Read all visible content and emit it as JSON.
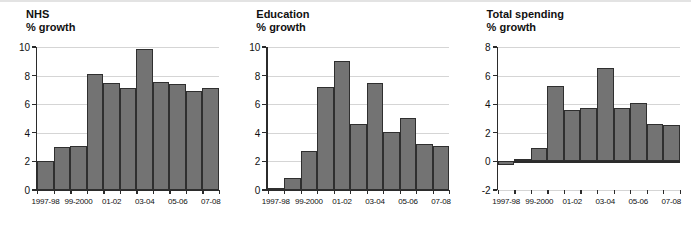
{
  "chart_data": [
    {
      "type": "bar",
      "title": "NHS",
      "subtitle": "% growth",
      "xlabel": "",
      "ylabel": "% growth",
      "ylim": [
        0,
        10
      ],
      "yticks": [
        0,
        2,
        4,
        6,
        8,
        10
      ],
      "ytick_labels": [
        "0",
        "2",
        "4",
        "6",
        "8",
        "10"
      ],
      "grid": true,
      "legend": "none",
      "categories": [
        "1997-98",
        "98-99",
        "99-2000",
        "00-01",
        "01-02",
        "02-03",
        "03-04",
        "04-05",
        "05-06",
        "06-07",
        "07-08"
      ],
      "tick_labels": [
        "1997-98",
        "",
        "99-2000",
        "",
        "01-02",
        "",
        "03-04",
        "",
        "05-06",
        "",
        "07-08"
      ],
      "values": [
        2.0,
        3.0,
        3.1,
        8.1,
        7.5,
        7.1,
        9.85,
        7.55,
        7.4,
        6.95,
        7.15
      ],
      "bar_color": "#737373",
      "bar_edge_color": "#2f2f2f"
    },
    {
      "type": "bar",
      "title": "Education",
      "subtitle": "% growth",
      "xlabel": "",
      "ylabel": "% growth",
      "ylim": [
        0,
        10
      ],
      "yticks": [
        0,
        2,
        4,
        6,
        8,
        10
      ],
      "ytick_labels": [
        "0",
        "2",
        "4",
        "6",
        "8",
        "10"
      ],
      "grid": true,
      "legend": "none",
      "categories": [
        "1997-98",
        "98-99",
        "99-2000",
        "00-01",
        "01-02",
        "02-03",
        "03-04",
        "04-05",
        "05-06",
        "06-07",
        "07-08"
      ],
      "tick_labels": [
        "1997-98",
        "",
        "99-2000",
        "",
        "01-02",
        "",
        "03-04",
        "",
        "05-06",
        "",
        "07-08"
      ],
      "values": [
        0.15,
        0.85,
        2.75,
        7.2,
        9.05,
        4.65,
        7.45,
        4.05,
        5.05,
        3.25,
        3.1
      ],
      "bar_color": "#737373",
      "bar_edge_color": "#2f2f2f"
    },
    {
      "type": "bar",
      "title": "Total spending",
      "subtitle": "% growth",
      "xlabel": "",
      "ylabel": "% growth",
      "ylim": [
        -2,
        8
      ],
      "yticks": [
        -2,
        0,
        2,
        4,
        6,
        8
      ],
      "ytick_labels": [
        "-2",
        "0",
        "2",
        "4",
        "6",
        "8"
      ],
      "grid": true,
      "legend": "none",
      "categories": [
        "1997-98",
        "98-99",
        "99-2000",
        "00-01",
        "01-02",
        "02-03",
        "03-04",
        "04-05",
        "05-06",
        "06-07",
        "07-08"
      ],
      "tick_labels": [
        "1997-98",
        "",
        "99-2000",
        "",
        "01-02",
        "",
        "03-04",
        "",
        "05-06",
        "",
        "07-08"
      ],
      "values": [
        -0.22,
        0.15,
        0.95,
        5.3,
        3.6,
        3.7,
        6.55,
        3.75,
        4.05,
        2.6,
        2.55
      ],
      "bar_color": "#737373",
      "bar_edge_color": "#2f2f2f"
    }
  ]
}
